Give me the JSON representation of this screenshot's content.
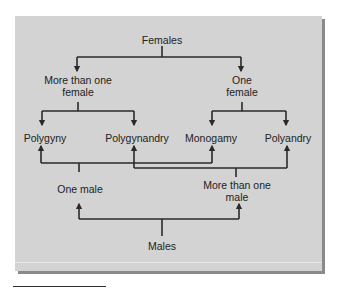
{
  "diagram": {
    "top_root": "Females",
    "female_branches": [
      {
        "line1": "More than one",
        "line2": "female"
      },
      {
        "line1": "One",
        "line2": "female"
      }
    ],
    "mating_systems": [
      "Polygyny",
      "Polygynandry",
      "Monogamy",
      "Polyandry"
    ],
    "male_branches": [
      {
        "line1": "One male",
        "line2": ""
      },
      {
        "line1": "More than one",
        "line2": "male"
      }
    ],
    "bottom_root": "Males",
    "colors": {
      "panel": "#d3d3d3",
      "line": "#2a2a2a",
      "text": "#222222",
      "shadow": "#8a8a8a"
    }
  }
}
